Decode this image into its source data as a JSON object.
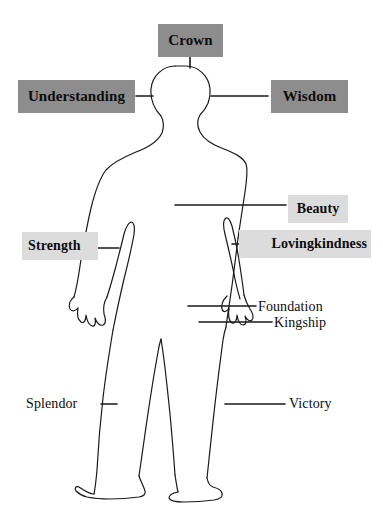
{
  "diagram": {
    "background_color": "#ffffff",
    "outline_color": "#1a1a1a",
    "box_dark_color": "#8d8d8d",
    "box_light_color": "#dcdcdc",
    "text_color": "#0d0d0d"
  },
  "labels": [
    {
      "id": "crown",
      "text": "Crown",
      "style": "boxed-dark"
    },
    {
      "id": "understanding",
      "text": "Understanding",
      "style": "boxed-dark"
    },
    {
      "id": "wisdom",
      "text": "Wisdom",
      "style": "boxed-dark"
    },
    {
      "id": "beauty",
      "text": "Beauty",
      "style": "boxed-light"
    },
    {
      "id": "strength",
      "text": "Strength",
      "style": "boxed-light"
    },
    {
      "id": "lovingkindness",
      "text": "Lovingkindness",
      "style": "boxed-light"
    },
    {
      "id": "foundation",
      "text": "Foundation",
      "style": "plain"
    },
    {
      "id": "kingship",
      "text": "Kingship",
      "style": "plain"
    },
    {
      "id": "splendor",
      "text": "Splendor",
      "style": "plain"
    },
    {
      "id": "victory",
      "text": "Victory",
      "style": "plain"
    }
  ],
  "figure": {
    "name": "human-body-outline"
  }
}
